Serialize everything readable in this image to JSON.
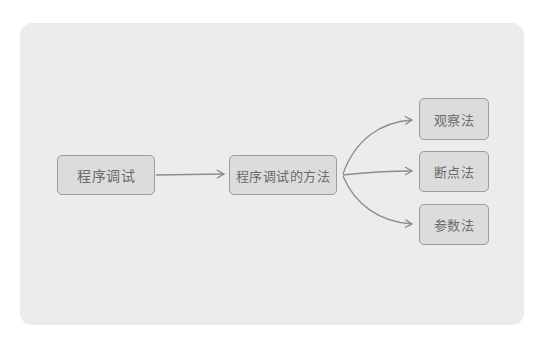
{
  "diagram": {
    "type": "flow",
    "nodes": [
      {
        "id": "root",
        "label": "程序调试"
      },
      {
        "id": "methods",
        "label": "程序调试的方法"
      },
      {
        "id": "observe",
        "label": "观察法"
      },
      {
        "id": "breakpoint",
        "label": "断点法"
      },
      {
        "id": "parameter",
        "label": "参数法"
      }
    ],
    "edges": [
      {
        "from": "root",
        "to": "methods"
      },
      {
        "from": "methods",
        "to": "observe"
      },
      {
        "from": "methods",
        "to": "breakpoint"
      },
      {
        "from": "methods",
        "to": "parameter"
      }
    ],
    "colors": {
      "panel": "#ececec",
      "node_fill": "#dcdcdc",
      "node_border": "#9c9c9c",
      "text": "#6a6a6a",
      "edge": "#8c8c8c"
    }
  }
}
